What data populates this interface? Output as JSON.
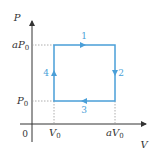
{
  "diagram": {
    "type": "PV cycle",
    "axes": {
      "y_label": "P",
      "x_label": "V",
      "origin_label": "0"
    },
    "ticks": {
      "y": [
        {
          "base": "aP",
          "sub": "0"
        },
        {
          "base": "P",
          "sub": "0"
        }
      ],
      "x": [
        {
          "base": "V",
          "sub": "0"
        },
        {
          "base": "aV",
          "sub": "0"
        }
      ]
    },
    "process_labels": [
      "1",
      "2",
      "3",
      "4"
    ],
    "colors": {
      "cycle": "#4a9fd8",
      "axis": "#333333",
      "dashed": "#999999",
      "label_process": "#4a9fd8"
    }
  }
}
